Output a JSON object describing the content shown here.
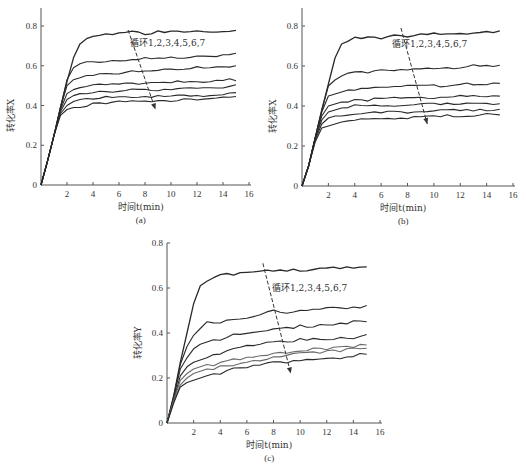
{
  "figure": {
    "colors": {
      "axis": "#555555",
      "curve_dark": "#2a2a2a",
      "curve_light": "#6a6a6a",
      "arrow": "#333333"
    }
  },
  "chart_data": [
    {
      "id": "a",
      "type": "line",
      "caption": "(a)",
      "xlabel": "时间t(min)",
      "ylabel": "转化率X",
      "xlim": [
        0,
        16
      ],
      "ylim": [
        0,
        0.8
      ],
      "xticks": [
        "2",
        "4",
        "6",
        "8",
        "10",
        "12",
        "14",
        "16"
      ],
      "yticks": [
        "0",
        "0.2",
        "0.4",
        "0.6",
        "0.8"
      ],
      "grid": false,
      "annotation": "循环1,2,3,4,5,6,7",
      "arrow": {
        "from": [
          6.7,
          0.78
        ],
        "to": [
          8.8,
          0.38
        ]
      },
      "x": [
        0,
        0.5,
        1,
        1.5,
        2,
        2.5,
        3,
        3.5,
        4,
        5,
        6,
        7,
        8,
        9,
        10,
        11,
        12,
        13,
        14,
        15
      ],
      "series": [
        {
          "name": "循环1",
          "values": [
            0,
            0.12,
            0.25,
            0.39,
            0.52,
            0.64,
            0.71,
            0.74,
            0.75,
            0.76,
            0.76,
            0.77,
            0.76,
            0.77,
            0.77,
            0.77,
            0.77,
            0.77,
            0.77,
            0.78
          ]
        },
        {
          "name": "循环2",
          "values": [
            0,
            0.12,
            0.25,
            0.39,
            0.53,
            0.59,
            0.61,
            0.62,
            0.62,
            0.62,
            0.63,
            0.63,
            0.64,
            0.64,
            0.64,
            0.64,
            0.65,
            0.65,
            0.65,
            0.66
          ]
        },
        {
          "name": "循环3",
          "values": [
            0,
            0.12,
            0.25,
            0.39,
            0.5,
            0.53,
            0.54,
            0.55,
            0.55,
            0.56,
            0.56,
            0.57,
            0.57,
            0.58,
            0.58,
            0.58,
            0.59,
            0.59,
            0.59,
            0.6
          ]
        },
        {
          "name": "循环4",
          "values": [
            0,
            0.12,
            0.25,
            0.38,
            0.46,
            0.48,
            0.49,
            0.5,
            0.5,
            0.51,
            0.51,
            0.51,
            0.51,
            0.52,
            0.52,
            0.52,
            0.52,
            0.52,
            0.53,
            0.53
          ]
        },
        {
          "name": "循环5",
          "values": [
            0,
            0.12,
            0.25,
            0.37,
            0.43,
            0.45,
            0.46,
            0.46,
            0.47,
            0.47,
            0.47,
            0.48,
            0.48,
            0.48,
            0.48,
            0.49,
            0.49,
            0.49,
            0.49,
            0.5
          ]
        },
        {
          "name": "循环6",
          "values": [
            0,
            0.12,
            0.25,
            0.36,
            0.4,
            0.42,
            0.43,
            0.43,
            0.43,
            0.44,
            0.44,
            0.44,
            0.44,
            0.45,
            0.45,
            0.45,
            0.45,
            0.45,
            0.46,
            0.46
          ]
        },
        {
          "name": "循环7",
          "values": [
            0,
            0.12,
            0.25,
            0.35,
            0.38,
            0.39,
            0.39,
            0.4,
            0.41,
            0.41,
            0.42,
            0.42,
            0.42,
            0.42,
            0.42,
            0.43,
            0.43,
            0.43,
            0.44,
            0.44
          ]
        }
      ]
    },
    {
      "id": "b",
      "type": "line",
      "caption": "(b)",
      "xlabel": "时间t(min)",
      "ylabel": "转化率X",
      "xlim": [
        0,
        16
      ],
      "ylim": [
        0,
        0.8
      ],
      "xticks": [
        "2",
        "4",
        "6",
        "8",
        "10",
        "12",
        "14",
        "16"
      ],
      "yticks": [
        "0",
        "0.2",
        "0.4",
        "0.6",
        "0.8"
      ],
      "grid": false,
      "annotation": "循环1,2,3,4,5,6,7",
      "arrow": {
        "from": [
          7.5,
          0.79
        ],
        "to": [
          9.5,
          0.31
        ]
      },
      "x": [
        0,
        0.5,
        1,
        1.5,
        2,
        2.5,
        3,
        3.5,
        4,
        5,
        6,
        7,
        8,
        9,
        10,
        11,
        12,
        13,
        14,
        15
      ],
      "series": [
        {
          "name": "循环1",
          "values": [
            0,
            0.1,
            0.24,
            0.38,
            0.51,
            0.64,
            0.71,
            0.73,
            0.74,
            0.74,
            0.74,
            0.75,
            0.75,
            0.76,
            0.76,
            0.76,
            0.76,
            0.76,
            0.77,
            0.77
          ]
        },
        {
          "name": "循环2",
          "values": [
            0,
            0.1,
            0.24,
            0.38,
            0.5,
            0.53,
            0.55,
            0.56,
            0.57,
            0.57,
            0.58,
            0.58,
            0.58,
            0.59,
            0.59,
            0.59,
            0.59,
            0.6,
            0.6,
            0.6
          ]
        },
        {
          "name": "循环3",
          "values": [
            0,
            0.1,
            0.24,
            0.37,
            0.45,
            0.46,
            0.47,
            0.48,
            0.48,
            0.49,
            0.49,
            0.5,
            0.5,
            0.5,
            0.5,
            0.5,
            0.51,
            0.51,
            0.51,
            0.51
          ]
        },
        {
          "name": "循环4",
          "values": [
            0,
            0.1,
            0.24,
            0.35,
            0.4,
            0.41,
            0.42,
            0.42,
            0.43,
            0.43,
            0.44,
            0.44,
            0.44,
            0.44,
            0.44,
            0.44,
            0.45,
            0.45,
            0.45,
            0.45
          ]
        },
        {
          "name": "循环5",
          "values": [
            0,
            0.1,
            0.24,
            0.33,
            0.37,
            0.38,
            0.39,
            0.39,
            0.4,
            0.4,
            0.4,
            0.4,
            0.4,
            0.41,
            0.41,
            0.41,
            0.41,
            0.41,
            0.41,
            0.41
          ]
        },
        {
          "name": "循环6",
          "values": [
            0,
            0.1,
            0.23,
            0.31,
            0.34,
            0.35,
            0.35,
            0.36,
            0.36,
            0.37,
            0.37,
            0.37,
            0.37,
            0.37,
            0.38,
            0.38,
            0.38,
            0.38,
            0.38,
            0.38
          ]
        },
        {
          "name": "循环7",
          "values": [
            0,
            0.1,
            0.22,
            0.29,
            0.3,
            0.31,
            0.32,
            0.33,
            0.33,
            0.34,
            0.34,
            0.34,
            0.34,
            0.35,
            0.35,
            0.35,
            0.35,
            0.35,
            0.36,
            0.36
          ]
        }
      ]
    },
    {
      "id": "c",
      "type": "line",
      "caption": "(c)",
      "xlabel": "时间t(min)",
      "ylabel": "转化率Y",
      "xlim": [
        0,
        16
      ],
      "ylim": [
        0,
        0.8
      ],
      "xticks": [
        "2",
        "4",
        "6",
        "8",
        "10",
        "12",
        "14",
        "16"
      ],
      "yticks": [
        "0",
        "0.2",
        "0.4",
        "0.6",
        "0.8"
      ],
      "grid": false,
      "annotation": "循环1,2,3,4,5,6,7",
      "arrow": {
        "from": [
          7.2,
          0.71
        ],
        "to": [
          9.3,
          0.22
        ]
      },
      "x": [
        0,
        0.5,
        1,
        1.5,
        2,
        2.5,
        3,
        3.5,
        4,
        5,
        6,
        7,
        8,
        9,
        10,
        11,
        12,
        13,
        14,
        15
      ],
      "series": [
        {
          "name": "循环1",
          "values": [
            0,
            0.12,
            0.27,
            0.4,
            0.53,
            0.61,
            0.63,
            0.65,
            0.66,
            0.66,
            0.67,
            0.67,
            0.68,
            0.68,
            0.68,
            0.68,
            0.69,
            0.69,
            0.69,
            0.7
          ]
        },
        {
          "name": "循环2",
          "values": [
            0,
            0.12,
            0.26,
            0.34,
            0.39,
            0.42,
            0.45,
            0.45,
            0.45,
            0.46,
            0.47,
            0.48,
            0.5,
            0.49,
            0.5,
            0.5,
            0.51,
            0.51,
            0.51,
            0.52
          ]
        },
        {
          "name": "循环3",
          "values": [
            0,
            0.11,
            0.24,
            0.29,
            0.33,
            0.35,
            0.36,
            0.37,
            0.37,
            0.39,
            0.4,
            0.41,
            0.42,
            0.42,
            0.43,
            0.43,
            0.44,
            0.44,
            0.45,
            0.45
          ]
        },
        {
          "name": "循环4",
          "values": [
            0,
            0.1,
            0.21,
            0.25,
            0.27,
            0.28,
            0.29,
            0.3,
            0.31,
            0.33,
            0.34,
            0.35,
            0.36,
            0.36,
            0.37,
            0.37,
            0.37,
            0.38,
            0.38,
            0.39
          ]
        },
        {
          "name": "循环5",
          "values": [
            0,
            0.1,
            0.19,
            0.22,
            0.24,
            0.25,
            0.26,
            0.26,
            0.27,
            0.28,
            0.29,
            0.3,
            0.31,
            0.31,
            0.32,
            0.33,
            0.33,
            0.34,
            0.34,
            0.35
          ]
        },
        {
          "name": "循环6",
          "values": [
            0,
            0.09,
            0.17,
            0.2,
            0.22,
            0.23,
            0.24,
            0.24,
            0.25,
            0.26,
            0.27,
            0.28,
            0.29,
            0.3,
            0.31,
            0.31,
            0.32,
            0.32,
            0.33,
            0.33
          ]
        },
        {
          "name": "循环7",
          "values": [
            0,
            0.09,
            0.16,
            0.18,
            0.19,
            0.2,
            0.21,
            0.22,
            0.22,
            0.24,
            0.25,
            0.26,
            0.27,
            0.27,
            0.28,
            0.28,
            0.29,
            0.29,
            0.3,
            0.31
          ]
        }
      ]
    }
  ]
}
